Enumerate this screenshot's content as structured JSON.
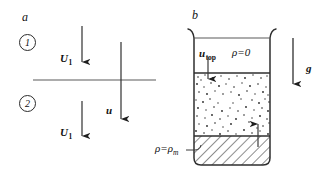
{
  "figure": {
    "width": 326,
    "height": 175,
    "background": "#ffffff",
    "line_color": "#3a3a3a",
    "text_color": "#111111"
  },
  "panel_a": {
    "letter": "a",
    "region_labels": [
      {
        "name": "region-1",
        "text": "1"
      },
      {
        "name": "region-2",
        "text": "2"
      }
    ],
    "interface_line": {
      "description": "horizontal shock/interface line"
    },
    "vectors": [
      {
        "name": "U1-upper",
        "label": "U",
        "subscript": "1",
        "direction": "down"
      },
      {
        "name": "U1-lower",
        "label": "U",
        "subscript": "1",
        "direction": "down"
      },
      {
        "name": "u-flow",
        "label": "u",
        "subscript": "",
        "direction": "down"
      }
    ]
  },
  "panel_b": {
    "letter": "b",
    "container": "beaker",
    "layers": [
      {
        "name": "vacuum-layer",
        "density_label": "ρ=0",
        "fill": "empty"
      },
      {
        "name": "fluid-layer",
        "density_label": "ρ=ρ",
        "density_subscript": "0",
        "fill": "speckled"
      },
      {
        "name": "metal-layer",
        "density_label": "ρ=ρ",
        "density_subscript": "m",
        "fill": "hatched"
      }
    ],
    "vectors": [
      {
        "name": "u-top",
        "label": "u",
        "subscript": "top",
        "direction": "down"
      },
      {
        "name": "u-bot",
        "label": "u",
        "subscript": "bot",
        "direction": "up"
      },
      {
        "name": "gravity",
        "label": "g",
        "subscript": "",
        "direction": "down"
      }
    ]
  }
}
